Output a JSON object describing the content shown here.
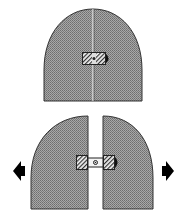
{
  "diagram": {
    "colors": {
      "fill": "#9a9a9a",
      "outline": "#333333",
      "arrow": "#000000",
      "background": "#ffffff"
    },
    "panels": [
      {
        "name": "closed-assembly",
        "state": "closed"
      },
      {
        "name": "open-assembly",
        "state": "separated"
      }
    ],
    "arrows": [
      {
        "name": "left-arrow",
        "direction": "left"
      },
      {
        "name": "right-arrow",
        "direction": "right"
      }
    ]
  }
}
